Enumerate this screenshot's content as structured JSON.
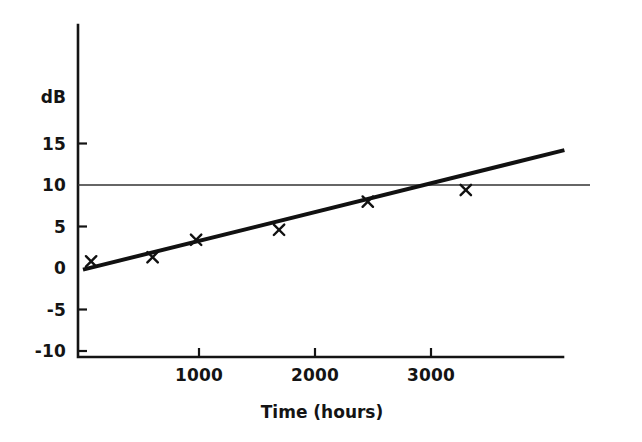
{
  "chart_data": {
    "type": "scatter",
    "title": "",
    "xlabel": "Time (hours)",
    "ylabel": "dB",
    "xlim": [
      0,
      4150
    ],
    "ylim": [
      -10,
      17
    ],
    "xticks": [
      1000,
      2000,
      3000
    ],
    "xtick_labels": [
      "1000",
      "2000",
      "3000"
    ],
    "yticks": [
      -10,
      -5,
      0,
      5,
      10,
      15
    ],
    "ytick_labels": [
      "-10",
      "-5",
      "0",
      "5",
      "10",
      "15"
    ],
    "grid": false,
    "legend": "none",
    "annotations": [
      {
        "name": "threshold-line",
        "type": "horizontal-line",
        "y": 10,
        "label": "",
        "color": "#333333"
      }
    ],
    "series": [
      {
        "name": "measurements",
        "type": "scatter",
        "marker": "x",
        "color": "#111111",
        "points": [
          {
            "x": 70,
            "y": 0.8
          },
          {
            "x": 600,
            "y": 1.3
          },
          {
            "x": 975,
            "y": 3.4
          },
          {
            "x": 1690,
            "y": 4.6
          },
          {
            "x": 2455,
            "y": 8.0
          },
          {
            "x": 3300,
            "y": 9.4
          }
        ]
      },
      {
        "name": "fitted-trend-line",
        "type": "line",
        "color": "#111111",
        "linewidth": 4,
        "points": [
          {
            "x": 0,
            "y": -0.2
          },
          {
            "x": 4150,
            "y": 14.2
          }
        ]
      }
    ]
  },
  "axes": {
    "y_axis_title": "dB",
    "x_axis_title": "Time (hours)"
  },
  "colors": {
    "background": "#ffffff",
    "ink": "#141414",
    "data": "#111111",
    "threshold": "#333333"
  }
}
